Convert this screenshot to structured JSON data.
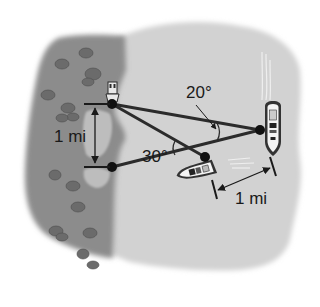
{
  "figure": {
    "type": "geometry-word-problem-illustration",
    "labels": {
      "angle_top": "20°",
      "angle_left": "30°",
      "distance_shore": "1 mi",
      "distance_boats": "1 mi"
    },
    "points": {
      "lighthouse_point": {
        "x": 112,
        "y": 104
      },
      "shore_point_lower": {
        "x": 112,
        "y": 167
      },
      "boat_near": {
        "x": 205,
        "y": 157
      },
      "boat_far": {
        "x": 260,
        "y": 130
      }
    },
    "colors": {
      "land": "#8c8c8c",
      "water": "#d2d2d2",
      "shallow_water": "#c4c4c4",
      "lines": "#2b2b2b",
      "text": "#1a1a1a",
      "rocks": "#6b6b6b"
    }
  }
}
